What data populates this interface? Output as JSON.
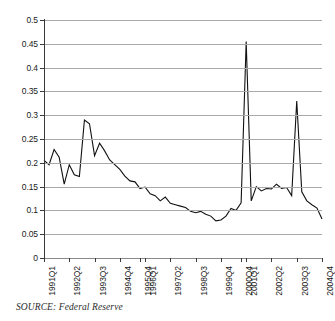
{
  "figure": {
    "source_note": "SOURCE: Federal Reserve",
    "title": ""
  },
  "chart_data": {
    "type": "line",
    "title": "",
    "subtitle": "",
    "xlabel": "",
    "ylabel": "",
    "ylim": [
      0,
      0.5
    ],
    "y_ticks": [
      "0",
      "0.05",
      "0.1",
      "0.15",
      "0.2",
      "0.25",
      "0.3",
      "0.35",
      "0.4",
      "0.45",
      "0.5"
    ],
    "y_tick_values": [
      0,
      0.05,
      0.1,
      0.15,
      0.2,
      0.25,
      0.3,
      0.35,
      0.4,
      0.45,
      0.5
    ],
    "grid": true,
    "legend": null,
    "legend_position": "none",
    "x_tick_labels": [
      "1991Q1",
      "1992Q2",
      "1993Q3",
      "1994Q4",
      "1995Q4",
      "1996Q1",
      "1997Q2",
      "1998Q3",
      "1999Q4",
      "2000Q4",
      "2001Q1",
      "2002Q2",
      "2003Q3",
      "2004Q4"
    ],
    "x_tick_index": [
      0,
      5,
      10,
      15,
      19,
      20,
      25,
      30,
      35,
      39,
      40,
      45,
      50,
      55
    ],
    "x": [
      "1991Q1",
      "1991Q2",
      "1991Q3",
      "1991Q4",
      "1992Q1",
      "1992Q2",
      "1992Q3",
      "1992Q4",
      "1993Q1",
      "1993Q2",
      "1993Q3",
      "1993Q4",
      "1994Q1",
      "1994Q2",
      "1994Q3",
      "1994Q4",
      "1995Q1",
      "1995Q2",
      "1995Q3",
      "1995Q4",
      "1996Q1",
      "1996Q2",
      "1996Q3",
      "1996Q4",
      "1997Q1",
      "1997Q2",
      "1997Q3",
      "1997Q4",
      "1998Q1",
      "1998Q2",
      "1998Q3",
      "1998Q4",
      "1999Q1",
      "1999Q2",
      "1999Q3",
      "1999Q4",
      "2000Q1",
      "2000Q2",
      "2000Q3",
      "2000Q4",
      "2001Q1",
      "2001Q2",
      "2001Q3",
      "2001Q4",
      "2002Q1",
      "2002Q2",
      "2002Q3",
      "2002Q4",
      "2003Q1",
      "2003Q2",
      "2003Q3",
      "2003Q4",
      "2004Q1",
      "2004Q2",
      "2004Q3",
      "2004Q4"
    ],
    "series": [
      {
        "name": "Federal Reserve series",
        "color": "#111111",
        "values": [
          0.205,
          0.196,
          0.228,
          0.212,
          0.155,
          0.196,
          0.175,
          0.171,
          0.29,
          0.282,
          0.215,
          0.241,
          0.225,
          0.206,
          0.196,
          0.186,
          0.172,
          0.162,
          0.16,
          0.146,
          0.149,
          0.135,
          0.131,
          0.12,
          0.128,
          0.115,
          0.112,
          0.109,
          0.106,
          0.098,
          0.095,
          0.098,
          0.092,
          0.088,
          0.078,
          0.08,
          0.088,
          0.104,
          0.1,
          0.116,
          0.455,
          0.12,
          0.15,
          0.141,
          0.146,
          0.145,
          0.155,
          0.146,
          0.148,
          0.131,
          0.33,
          0.139,
          0.12,
          0.112,
          0.105,
          0.082
        ]
      }
    ],
    "annotations": [
      {
        "label": "spike",
        "x": "2001Q1",
        "y": 0.455
      },
      {
        "label": "spike",
        "x": "2003Q3",
        "y": 0.33
      }
    ]
  }
}
